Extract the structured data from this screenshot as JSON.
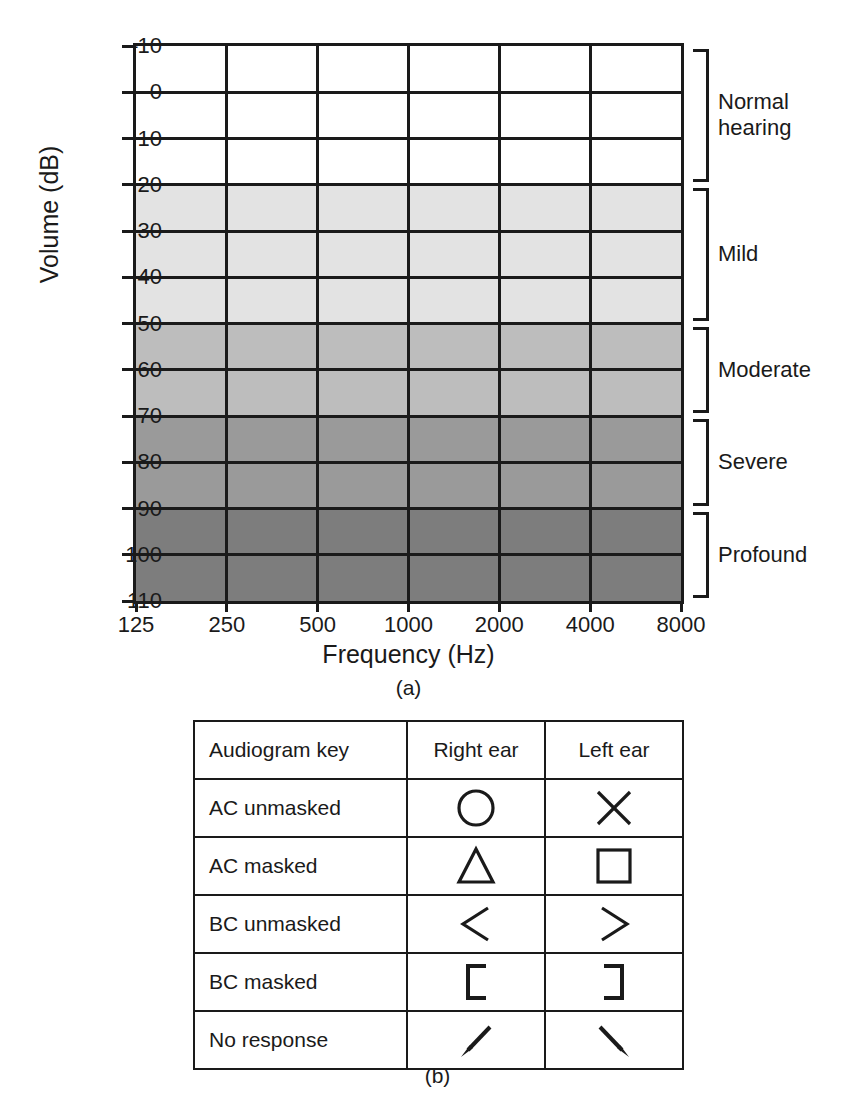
{
  "figure_a": {
    "caption": "(a)",
    "xlabel": "Frequency (Hz)",
    "ylabel": "Volume (dB)",
    "right_axis_label": "Hearing loss"
  },
  "figure_b": {
    "caption": "(b)"
  },
  "chart_data": {
    "type": "heatmap",
    "title": "",
    "xlabel": "Frequency (Hz)",
    "ylabel": "Volume (dB)",
    "right_axis_label": "Hearing loss",
    "grid": true,
    "legend_position": "right",
    "x": [
      125,
      250,
      500,
      1000,
      2000,
      4000,
      8000
    ],
    "xtick_labels": [
      "125",
      "250",
      "500",
      "1000",
      "2000",
      "4000",
      "8000"
    ],
    "xscale": "log-categorical",
    "y": [
      -10,
      0,
      10,
      20,
      30,
      40,
      50,
      60,
      70,
      80,
      90,
      100,
      110
    ],
    "ytick_labels": [
      "–10",
      "0",
      "10",
      "20",
      "30",
      "40",
      "50",
      "60",
      "70",
      "80",
      "90",
      "100",
      "110"
    ],
    "ylim": [
      -10,
      110
    ],
    "y_inverted": true,
    "bands": [
      {
        "label": "Normal hearing",
        "from": -10,
        "to": 20,
        "color": "#ffffff"
      },
      {
        "label": "Mild",
        "from": 20,
        "to": 50,
        "color": "#e3e3e3"
      },
      {
        "label": "Moderate",
        "from": 50,
        "to": 70,
        "color": "#bdbdbd"
      },
      {
        "label": "Severe",
        "from": 70,
        "to": 90,
        "color": "#9a9a9a"
      },
      {
        "label": "Profound",
        "from": 90,
        "to": 110,
        "color": "#7d7d7d"
      }
    ],
    "series": []
  },
  "key_table": {
    "headers": [
      "Audiogram key",
      "Right ear",
      "Left ear"
    ],
    "rows": [
      {
        "label": "AC unmasked",
        "right_symbol": "circle-icon",
        "left_symbol": "cross-icon"
      },
      {
        "label": "AC masked",
        "right_symbol": "triangle-icon",
        "left_symbol": "square-icon"
      },
      {
        "label": "BC unmasked",
        "right_symbol": "less-than-icon",
        "left_symbol": "greater-than-icon"
      },
      {
        "label": "BC masked",
        "right_symbol": "bracket-left-icon",
        "left_symbol": "bracket-right-icon"
      },
      {
        "label": "No response",
        "right_symbol": "arrow-down-left-icon",
        "left_symbol": "arrow-down-right-icon"
      }
    ]
  }
}
